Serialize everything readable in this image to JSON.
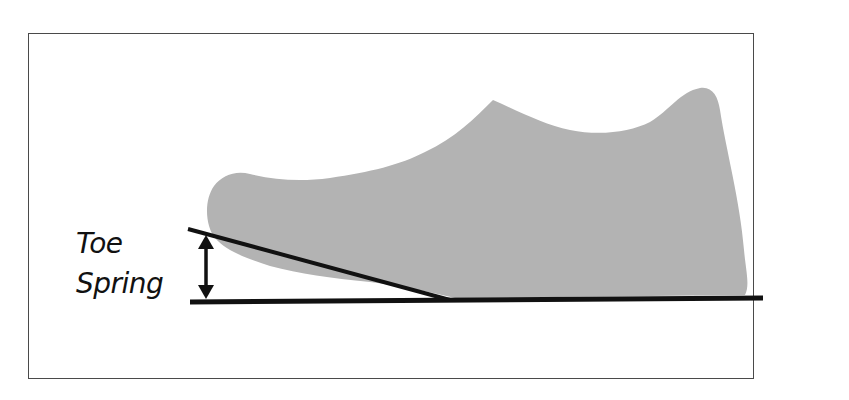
{
  "diagram": {
    "labels": {
      "line1": "Toe",
      "line2": "Spring"
    },
    "colors": {
      "shoe_fill": "#b3b3b3",
      "line": "#111111",
      "frame": "#4a4a4a",
      "background": "#ffffff",
      "text": "#111111"
    },
    "elements": [
      {
        "name": "shoe-silhouette",
        "description": "gray side-profile shoe shape"
      },
      {
        "name": "ground-line",
        "description": "horizontal black baseline"
      },
      {
        "name": "toe-incline-line",
        "description": "slanted black line under raised toe"
      },
      {
        "name": "measurement-arrow",
        "description": "double-headed vertical arrow showing toe spring height"
      }
    ]
  }
}
